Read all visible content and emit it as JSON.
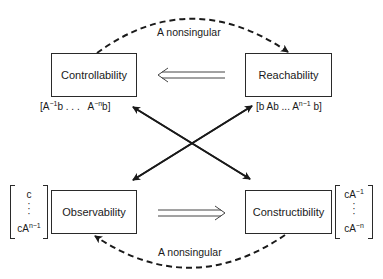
{
  "diagram": {
    "nodes": {
      "controllability": {
        "label": "Controllability"
      },
      "reachability": {
        "label": "Reachability"
      },
      "observability": {
        "label": "Observability"
      },
      "constructibility": {
        "label": "Constructibility"
      }
    },
    "matrices": {
      "controllability": {
        "open": "[A",
        "exp1": "−1",
        "mid": "b . . .   A",
        "exp2": "−n",
        "close": "b]"
      },
      "reachability": {
        "open": "[b Ab  ...  A",
        "exp1": "n−1",
        "close": " b]"
      },
      "observability": {
        "top": "c",
        "dots": "·\n·\n·",
        "bottom_base": "cA",
        "bottom_exp": "n−1"
      },
      "constructibility": {
        "top_base": "cA",
        "top_exp": "−1",
        "dots": "·\n·\n·",
        "bottom_base": "cA",
        "bottom_exp": "−n"
      }
    },
    "edges": [
      {
        "from": "controllability",
        "to": "reachability",
        "style": "dashed-arc",
        "label": "A nonsingular"
      },
      {
        "from": "constructibility",
        "to": "observability",
        "style": "dashed-arc",
        "label": "A nonsingular"
      },
      {
        "from": "reachability",
        "to": "controllability",
        "style": "double-implication"
      },
      {
        "from": "observability",
        "to": "constructibility",
        "style": "double-implication"
      },
      {
        "from": "controllability-matrix",
        "to": "constructibility",
        "style": "bidirectional-diagonal"
      },
      {
        "from": "reachability-matrix",
        "to": "observability",
        "style": "bidirectional-diagonal"
      }
    ],
    "edge_labels": {
      "top": "A nonsingular",
      "bottom": "A nonsingular"
    }
  }
}
